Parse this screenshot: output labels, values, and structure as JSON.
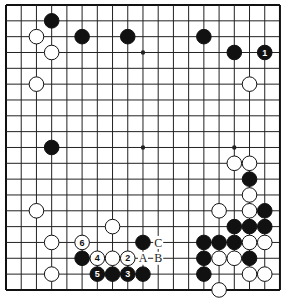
{
  "board": {
    "size": 19,
    "origin_x": 6,
    "origin_y": 5,
    "spacing_x": 15.22,
    "spacing_y": 15.83,
    "stone_radius": 7.3,
    "line_color": "#222222",
    "edge_color": "#111111",
    "black_color": "#111111",
    "white_color": "#ffffff",
    "star_points": [
      [
        9,
        3
      ],
      [
        9,
        9
      ],
      [
        15,
        9
      ]
    ]
  },
  "stones": [
    {
      "color": "black",
      "col": 3,
      "row": 1
    },
    {
      "color": "white",
      "col": 2,
      "row": 2
    },
    {
      "color": "black",
      "col": 5,
      "row": 2
    },
    {
      "color": "black",
      "col": 8,
      "row": 2
    },
    {
      "color": "white",
      "col": 3,
      "row": 3
    },
    {
      "color": "white",
      "col": 2,
      "row": 5
    },
    {
      "color": "black",
      "col": 3,
      "row": 9
    },
    {
      "color": "black",
      "col": 13,
      "row": 2
    },
    {
      "color": "black",
      "col": 15,
      "row": 3
    },
    {
      "color": "black",
      "col": 17,
      "row": 3,
      "label": "1"
    },
    {
      "color": "white",
      "col": 16,
      "row": 5
    },
    {
      "color": "white",
      "col": 15,
      "row": 10
    },
    {
      "color": "white",
      "col": 16,
      "row": 10
    },
    {
      "color": "black",
      "col": 16,
      "row": 11
    },
    {
      "color": "white",
      "col": 16,
      "row": 12
    },
    {
      "color": "white",
      "col": 2,
      "row": 13
    },
    {
      "color": "white",
      "col": 14,
      "row": 13
    },
    {
      "color": "white",
      "col": 16,
      "row": 13
    },
    {
      "color": "black",
      "col": 17,
      "row": 13
    },
    {
      "color": "white",
      "col": 7,
      "row": 14
    },
    {
      "color": "black",
      "col": 15,
      "row": 14
    },
    {
      "color": "black",
      "col": 16,
      "row": 14
    },
    {
      "color": "black",
      "col": 17,
      "row": 14
    },
    {
      "color": "white",
      "col": 3,
      "row": 15
    },
    {
      "color": "white",
      "col": 5,
      "row": 15,
      "label": "6"
    },
    {
      "color": "black",
      "col": 9,
      "row": 15
    },
    {
      "color": "black",
      "col": 13,
      "row": 15
    },
    {
      "color": "black",
      "col": 14,
      "row": 15
    },
    {
      "color": "black",
      "col": 15,
      "row": 15
    },
    {
      "color": "white",
      "col": 16,
      "row": 15
    },
    {
      "color": "white",
      "col": 17,
      "row": 15
    },
    {
      "color": "black",
      "col": 5,
      "row": 16
    },
    {
      "color": "white",
      "col": 6,
      "row": 16,
      "label": "4"
    },
    {
      "color": "white",
      "col": 7,
      "row": 16
    },
    {
      "color": "white",
      "col": 8,
      "row": 16,
      "label": "2"
    },
    {
      "color": "black",
      "col": 13,
      "row": 16
    },
    {
      "color": "white",
      "col": 14,
      "row": 16
    },
    {
      "color": "white",
      "col": 15,
      "row": 16
    },
    {
      "color": "black",
      "col": 16,
      "row": 16
    },
    {
      "color": "white",
      "col": 3,
      "row": 17
    },
    {
      "color": "black",
      "col": 6,
      "row": 17,
      "label": "5"
    },
    {
      "color": "black",
      "col": 7,
      "row": 17
    },
    {
      "color": "black",
      "col": 8,
      "row": 17,
      "label": "3"
    },
    {
      "color": "black",
      "col": 9,
      "row": 17
    },
    {
      "color": "black",
      "col": 13,
      "row": 17
    },
    {
      "color": "white",
      "col": 16,
      "row": 17
    },
    {
      "color": "white",
      "col": 17,
      "row": 17
    },
    {
      "color": "white",
      "col": 14,
      "row": 18
    }
  ],
  "marks": [
    {
      "label": "C",
      "col": 10,
      "row": 15
    },
    {
      "label": "A",
      "col": 9,
      "row": 16
    },
    {
      "label": "B",
      "col": 10,
      "row": 16
    }
  ]
}
